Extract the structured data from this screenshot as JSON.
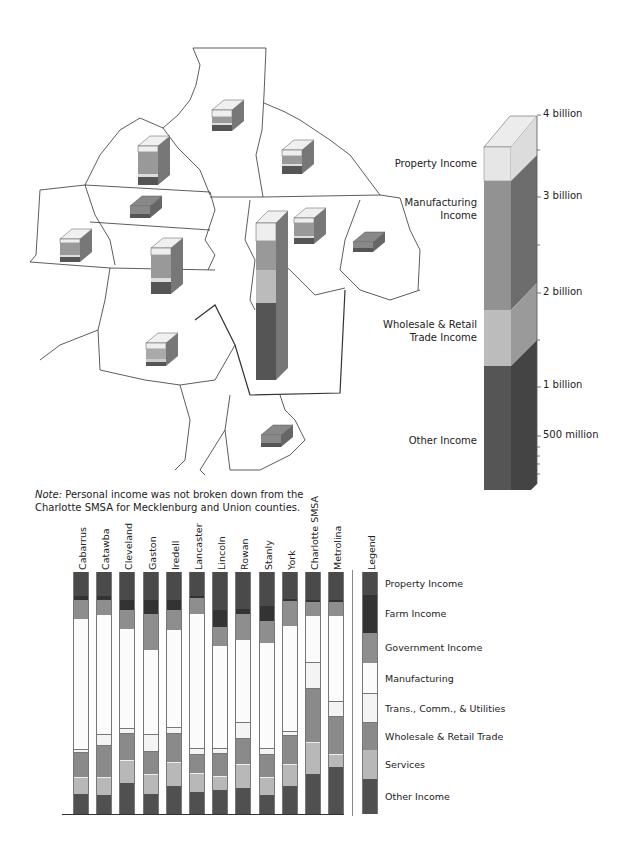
{
  "map": {
    "description": "Regional county map with 3D stacked income blocks",
    "scale_bar": {
      "ticks": [
        {
          "label": "4 billion",
          "y": 115
        },
        {
          "label": "3 billion",
          "y": 197
        },
        {
          "label": "2 billion",
          "y": 293
        },
        {
          "label": "1 billion",
          "y": 385
        },
        {
          "label": "500 million",
          "y": 436
        }
      ],
      "segments": [
        {
          "label_lines": [
            "Property Income"
          ],
          "y": 158
        },
        {
          "label_lines": [
            "Manufacturing",
            "Income"
          ],
          "y": 198
        },
        {
          "label_lines": [
            "Wholesale & Retail",
            "Trade Income"
          ],
          "y": 320
        },
        {
          "label_lines": [
            "Other Income"
          ],
          "y": 435
        }
      ]
    }
  },
  "note": {
    "prefix": "Note:",
    "line1": " Personal income was not broken down from the",
    "line2": "Charlotte SMSA for Mecklenburg and Union counties."
  },
  "colors": {
    "property": "#4a4a4a",
    "farm": "#333333",
    "government": "#8e8e8e",
    "manufacturing": "#fbfbfb",
    "trans": "#f4f4f4",
    "wholesale": "#8a8a8a",
    "services": "#b8b8b8",
    "other": "#505050"
  },
  "chart_data": {
    "type": "bar",
    "stacked": true,
    "orientation": "vertical",
    "xlabel": "",
    "ylabel": "",
    "categories": [
      "Cabarrus",
      "Catawba",
      "Cleveland",
      "Gaston",
      "Iredell",
      "Lancaster",
      "Lincoln",
      "Rowan",
      "Stanly",
      "York",
      "Charlotte SMSA",
      "Metrolina"
    ],
    "series": [
      {
        "name": "Property Income",
        "key": "property",
        "values": [
          9.9,
          9.9,
          11.6,
          11.6,
          11.6,
          9.9,
          15.7,
          15.4,
          14.2,
          11.3,
          11.7,
          11.7
        ]
      },
      {
        "name": "Farm Income",
        "key": "farm",
        "values": [
          1.7,
          1.7,
          4.1,
          5.8,
          4.1,
          0.8,
          7.0,
          2.1,
          6.3,
          0.8,
          0.8,
          0.8
        ]
      },
      {
        "name": "Government Income",
        "key": "government",
        "values": [
          7.9,
          6.2,
          7.9,
          14.9,
          8.3,
          6.6,
          7.9,
          10.8,
          8.8,
          10.4,
          5.8,
          5.8
        ]
      },
      {
        "name": "Manufacturing",
        "key": "manufacturing",
        "values": [
          54.1,
          49.6,
          41.3,
          35.1,
          40.5,
          55.8,
          42.6,
          34.2,
          44.2,
          43.7,
          19.2,
          35.4
        ]
      },
      {
        "name": "Trans., Comm., & Utilities",
        "key": "trans",
        "values": [
          1.2,
          4.5,
          2.1,
          7.0,
          2.5,
          2.5,
          2.1,
          6.7,
          2.1,
          1.7,
          10.8,
          6.3
        ]
      },
      {
        "name": "Wholesale & Retail Trade",
        "key": "wholesale",
        "values": [
          9.9,
          12.8,
          10.7,
          9.1,
          11.6,
          7.4,
          9.1,
          10.0,
          9.2,
          11.7,
          22.1,
          15.4
        ]
      },
      {
        "name": "Services",
        "key": "services",
        "values": [
          7.0,
          7.4,
          9.5,
          8.3,
          9.9,
          7.9,
          5.8,
          10.0,
          7.5,
          8.8,
          13.3,
          5.0
        ]
      },
      {
        "name": "Other Income",
        "key": "other",
        "values": [
          8.3,
          7.9,
          12.8,
          8.3,
          11.6,
          9.1,
          9.9,
          10.8,
          7.9,
          11.7,
          16.3,
          19.6
        ]
      }
    ],
    "legend": {
      "title": "Legend",
      "position": "right",
      "entries": [
        "Property Income",
        "Farm Income",
        "Government Income",
        "Manufacturing",
        "Trans., Comm., & Utilities",
        "Wholesale & Retail Trade",
        "Services",
        "Other Income"
      ]
    },
    "map_scale_axis": {
      "type": "3d-stacked-column",
      "ticks": [
        "4 billion",
        "3 billion",
        "2 billion",
        "1 billion",
        "500 million"
      ],
      "segments": [
        "Property Income",
        "Manufacturing Income",
        "Wholesale & Retail Trade Income",
        "Other Income"
      ]
    },
    "grid": false
  },
  "legend": {
    "title": "Legend",
    "items": [
      {
        "label": "Property Income",
        "key": "property",
        "h": 23
      },
      {
        "label": "Farm Income",
        "key": "farm",
        "h": 38
      },
      {
        "label": "Government Income",
        "key": "government",
        "h": 30
      },
      {
        "label": "Manufacturing",
        "key": "manufacturing",
        "h": 31
      },
      {
        "label": "Trans., Comm., & Utilities",
        "key": "trans",
        "h": 29
      },
      {
        "label": "Wholesale & Retail Trade",
        "key": "wholesale",
        "h": 27
      },
      {
        "label": "Services",
        "key": "services",
        "h": 29
      },
      {
        "label": "Other Income",
        "key": "other",
        "h": 35
      }
    ]
  }
}
